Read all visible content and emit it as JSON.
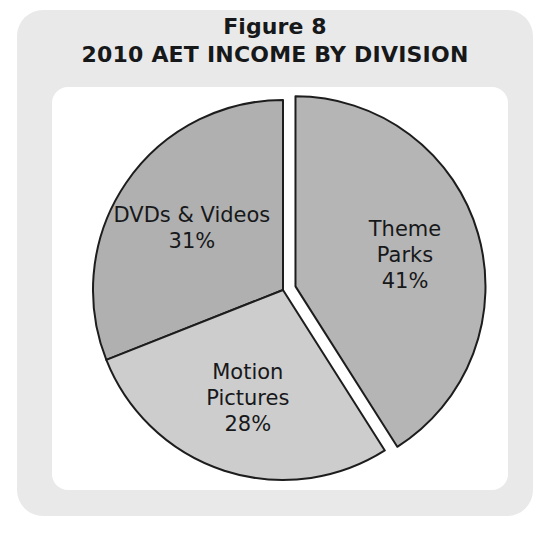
{
  "figure": {
    "title_line_1": "Figure 8",
    "title_line_2": "2010 AET INCOME BY DIVISION"
  },
  "colors": {
    "frame": "#e9e9e9",
    "card": "#ffffff",
    "slice_outline": "#1d1d1d",
    "theme_parks": "#b5b5b5",
    "dvds_videos": "#b0b0b0",
    "motion_pictures": "#cdcdcd",
    "text": "#17181a"
  },
  "chart_data": {
    "type": "pie",
    "title": "2010 AET INCOME BY DIVISION",
    "subtitle": "Figure 8",
    "xlabel": "",
    "ylabel": "",
    "categories": [
      "Theme Parks",
      "DVDs & Videos",
      "Motion Pictures"
    ],
    "values": [
      41,
      31,
      28
    ],
    "value_unit": "%",
    "start_angle_deg": 0,
    "direction": "clockwise",
    "legend": "none",
    "grid": false,
    "slices": [
      {
        "label": "Theme Parks",
        "label_lines": [
          "Theme",
          "Parks",
          "41%"
        ],
        "value": 41,
        "value_label": "41%",
        "color": "#b5b5b5",
        "exploded": true,
        "start_deg": 0,
        "end_deg": 147.6
      },
      {
        "label": "DVDs & Videos",
        "label_lines": [
          "DVDs & Videos",
          "31%"
        ],
        "value": 31,
        "value_label": "31%",
        "color": "#b0b0b0",
        "exploded": false,
        "start_deg": 248.4,
        "end_deg": 360
      },
      {
        "label": "Motion Pictures",
        "label_lines": [
          "Motion",
          "Pictures",
          "28%"
        ],
        "value": 28,
        "value_label": "28%",
        "color": "#cdcdcd",
        "exploded": false,
        "start_deg": 147.6,
        "end_deg": 248.4
      }
    ]
  }
}
